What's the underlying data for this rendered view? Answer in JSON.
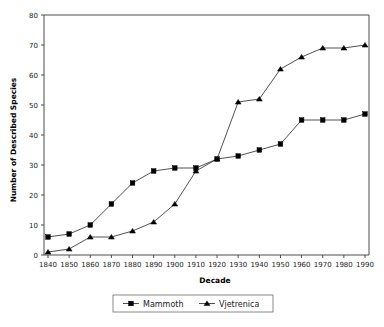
{
  "chart_data": {
    "type": "line",
    "title": "",
    "xlabel": "Decade",
    "ylabel": "Number of Described Species",
    "categories": [
      "1840",
      "1850",
      "1860",
      "1870",
      "1880",
      "1890",
      "1900",
      "1910",
      "1920",
      "1930",
      "1940",
      "1950",
      "1960",
      "1970",
      "1980",
      "1990"
    ],
    "x": [
      1840,
      1850,
      1860,
      1870,
      1880,
      1890,
      1900,
      1910,
      1920,
      1930,
      1940,
      1950,
      1960,
      1970,
      1980,
      1990
    ],
    "series": [
      {
        "name": "Mammoth",
        "marker": "square",
        "color": "#000000",
        "values": [
          6,
          7,
          10,
          17,
          24,
          28,
          29,
          29,
          32,
          33,
          35,
          37,
          45,
          45,
          45,
          47
        ]
      },
      {
        "name": "Vjetrenica",
        "marker": "triangle",
        "color": "#000000",
        "values": [
          1,
          2,
          6,
          6,
          8,
          11,
          17,
          28,
          32,
          51,
          52,
          62,
          66,
          69,
          69,
          70
        ]
      }
    ],
    "ylim": [
      0,
      80
    ],
    "yticks": [
      0,
      10,
      20,
      30,
      40,
      50,
      60,
      70,
      80
    ],
    "xlim": [
      1835,
      1995
    ],
    "grid": false,
    "legend_position": "bottom"
  },
  "axes": {
    "y_label": "Number of Described Species",
    "x_label": "Decade",
    "y_tick_labels": [
      "0",
      "10",
      "20",
      "30",
      "40",
      "50",
      "60",
      "70",
      "80"
    ],
    "x_tick_labels": [
      "1840",
      "1850",
      "1860",
      "1870",
      "1880",
      "1890",
      "1900",
      "1910",
      "1920",
      "1930",
      "1940",
      "1950",
      "1960",
      "1970",
      "1980",
      "1990"
    ]
  },
  "legend": {
    "items": [
      {
        "label": "Mammoth",
        "marker": "square"
      },
      {
        "label": "Vjetrenica",
        "marker": "triangle"
      }
    ]
  },
  "colors": {
    "background": "#ffffff",
    "axis": "#4d4d4d",
    "series": "#000000",
    "text": "#1a1a1a"
  }
}
